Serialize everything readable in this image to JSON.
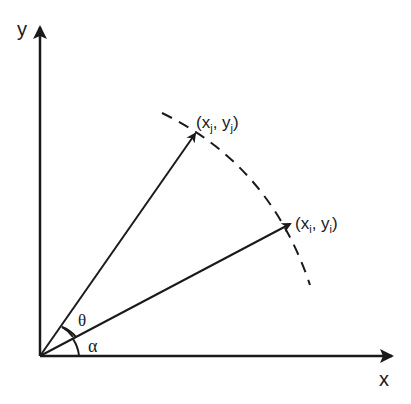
{
  "diagram": {
    "axes": {
      "x_label": "x",
      "y_label": "y"
    },
    "points": [
      {
        "id": "j",
        "label_open": "(x",
        "sub1": "j",
        "label_mid": ", y",
        "sub2": "j",
        "label_close": ")"
      },
      {
        "id": "i",
        "label_open": "(x",
        "sub1": "i",
        "label_mid": ", y",
        "sub2": "i",
        "label_close": ")"
      }
    ],
    "angles": {
      "theta": "θ",
      "alpha": "α"
    },
    "colors": {
      "stroke": "#1a1a1a",
      "background": "#ffffff"
    }
  }
}
